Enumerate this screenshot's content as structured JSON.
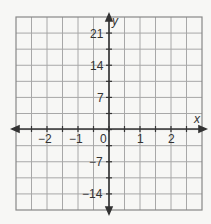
{
  "chart_data": {
    "type": "coordinate-grid",
    "title": "",
    "xlabel": "x",
    "ylabel": "y",
    "xlim": [
      -3,
      3
    ],
    "ylim": [
      -21,
      24.5
    ],
    "x_ticks": [
      -2,
      -1,
      0,
      1,
      2
    ],
    "x_tick_labels": [
      "−2",
      "−1",
      "0",
      "1",
      "2"
    ],
    "y_ticks": [
      21,
      14,
      7,
      -7,
      -14
    ],
    "y_tick_labels": [
      "21",
      "14",
      "7",
      "−7",
      "−14"
    ],
    "grid": true,
    "grid_columns": 12,
    "grid_rows": 12,
    "x_units_per_column": 0.5,
    "y_units_per_row": 3.5,
    "series": []
  },
  "colors": {
    "grid": "#a8a8a8",
    "axis": "#333333",
    "background": "#f7f7f5"
  }
}
